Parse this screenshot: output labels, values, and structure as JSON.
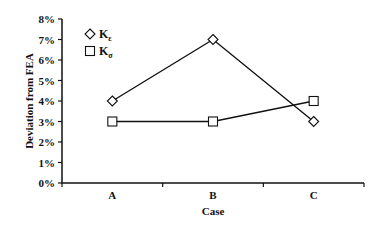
{
  "chart_data": {
    "type": "line",
    "title": "",
    "xlabel": "Case",
    "ylabel": "Deviation from FEA",
    "categories": [
      "A",
      "B",
      "C"
    ],
    "series": [
      {
        "name": "Kε",
        "base": "K",
        "sub": "ε",
        "marker": "diamond",
        "values": [
          4,
          7,
          3
        ]
      },
      {
        "name": "Kσ",
        "base": "K",
        "sub": "σ",
        "marker": "square",
        "values": [
          3,
          3,
          4
        ]
      }
    ],
    "ylim": [
      0,
      8
    ],
    "yticks": [
      "0%",
      "1%",
      "2%",
      "3%",
      "4%",
      "5%",
      "6%",
      "7%",
      "8%"
    ],
    "grid": false,
    "legend_position": "upper-left-inside",
    "colors": {
      "line": "#111111",
      "marker_fill": "#ffffff"
    }
  }
}
